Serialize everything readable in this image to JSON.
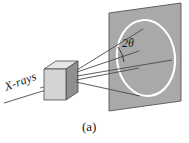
{
  "figure": {
    "caption": "(a)",
    "labels": {
      "incident_beam": "X-rays",
      "angle": "2θ"
    },
    "colors": {
      "screen_fill": "#a9a9a9",
      "screen_stroke": "#555555",
      "crystal_front": "#d4d4d4",
      "crystal_side": "#8f8f8f",
      "crystal_top": "#e6e6e6",
      "crystal_stroke": "#4a4a4a",
      "ray_stroke": "#4a4a4a",
      "ring_stroke": "#ffffff",
      "text": "#1a1a1a",
      "background": "#ffffff"
    },
    "elements": {
      "screen_name": "detector-screen",
      "ring_name": "diffraction-ring",
      "crystal_name": "crystal-sample",
      "incident_ray_name": "incident-xray-beam",
      "diffracted_rays_count": 5,
      "angle_arc_name": "two-theta-arc"
    }
  }
}
